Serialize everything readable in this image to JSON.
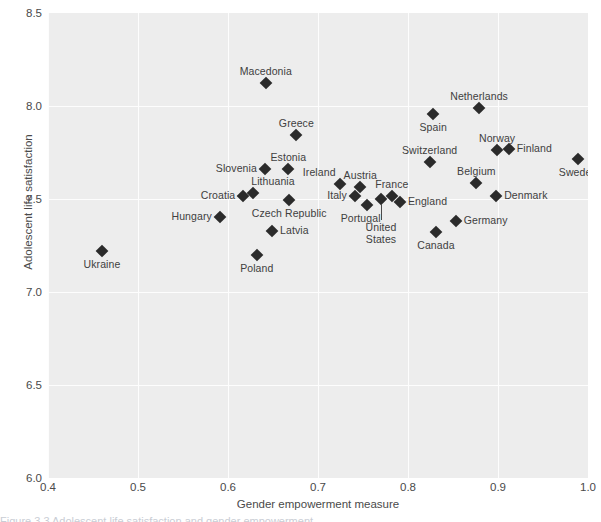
{
  "chart_data": {
    "type": "scatter",
    "title": "",
    "xlabel": "Gender empowerment measure",
    "ylabel": "Adolescent life satisfaction",
    "xlim": [
      0.4,
      1.0
    ],
    "ylim": [
      6.0,
      8.5
    ],
    "xticks": [
      "0.4",
      "0.5",
      "0.6",
      "0.7",
      "0.8",
      "0.9",
      "1.0"
    ],
    "yticks": [
      "6.0",
      "6.5",
      "7.0",
      "7.5",
      "8.0",
      "8.5"
    ],
    "grid": true,
    "legend": "none",
    "marker": "diamond",
    "marker_color": "#2b2b2b",
    "panel_color": "#ededed",
    "gridline_color": "#fdfdfd",
    "points": [
      {
        "label": "Ukraine",
        "x": 0.46,
        "y": 7.22,
        "pos": "below"
      },
      {
        "label": "Hungary",
        "x": 0.591,
        "y": 7.403,
        "pos": "left"
      },
      {
        "label": "Croatia",
        "x": 0.617,
        "y": 7.516,
        "pos": "left"
      },
      {
        "label": "Lithuania",
        "x": 0.628,
        "y": 7.532,
        "pos": "above-right"
      },
      {
        "label": "Slovenia",
        "x": 0.641,
        "y": 7.661,
        "pos": "left"
      },
      {
        "label": "Poland",
        "x": 0.632,
        "y": 7.199,
        "pos": "below"
      },
      {
        "label": "Latvia",
        "x": 0.649,
        "y": 7.328,
        "pos": "right"
      },
      {
        "label": "Macedonia",
        "x": 0.642,
        "y": 8.124,
        "pos": "above"
      },
      {
        "label": "Estonia",
        "x": 0.667,
        "y": 7.661,
        "pos": "above"
      },
      {
        "label": "Czech Republic",
        "x": 0.668,
        "y": 7.495,
        "pos": "below"
      },
      {
        "label": "Greece",
        "x": 0.676,
        "y": 7.844,
        "pos": "above"
      },
      {
        "label": "Ireland",
        "x": 0.724,
        "y": 7.58,
        "pos": "above-left"
      },
      {
        "label": "Italy",
        "x": 0.741,
        "y": 7.516,
        "pos": "left"
      },
      {
        "label": "Austria",
        "x": 0.747,
        "y": 7.564,
        "pos": "above"
      },
      {
        "label": "Portugal",
        "x": 0.754,
        "y": 7.468,
        "pos": "below-left"
      },
      {
        "label": "United States",
        "x": 0.77,
        "y": 7.5,
        "pos": "below-leader"
      },
      {
        "label": "France",
        "x": 0.782,
        "y": 7.516,
        "pos": "above"
      },
      {
        "label": "England",
        "x": 0.791,
        "y": 7.484,
        "pos": "right"
      },
      {
        "label": "Spain",
        "x": 0.828,
        "y": 7.956,
        "pos": "below"
      },
      {
        "label": "Switzerland",
        "x": 0.824,
        "y": 7.699,
        "pos": "above"
      },
      {
        "label": "Canada",
        "x": 0.831,
        "y": 7.323,
        "pos": "below"
      },
      {
        "label": "Netherlands",
        "x": 0.879,
        "y": 7.989,
        "pos": "above"
      },
      {
        "label": "Germany",
        "x": 0.853,
        "y": 7.382,
        "pos": "right"
      },
      {
        "label": "Belgium",
        "x": 0.876,
        "y": 7.586,
        "pos": "above"
      },
      {
        "label": "Norway",
        "x": 0.899,
        "y": 7.764,
        "pos": "above"
      },
      {
        "label": "Finland",
        "x": 0.912,
        "y": 7.769,
        "pos": "right"
      },
      {
        "label": "Denmark",
        "x": 0.898,
        "y": 7.516,
        "pos": "right"
      },
      {
        "label": "Sweden",
        "x": 0.989,
        "y": 7.715,
        "pos": "below"
      }
    ]
  },
  "caption": {
    "sliver_text": "Figure 3.3    Adolescent life satisfaction and gender empowerment"
  }
}
